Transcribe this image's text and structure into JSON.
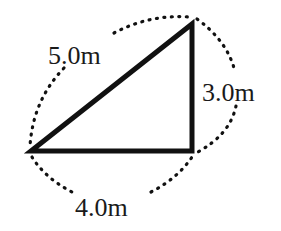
{
  "diagram": {
    "type": "right-triangle",
    "vertices": {
      "left": [
        31,
        151
      ],
      "top_right": [
        192,
        24
      ],
      "bottom_right": [
        192,
        151
      ]
    },
    "sides": [
      {
        "name": "hypotenuse",
        "label": "5.0m",
        "length": 5.0
      },
      {
        "name": "vertical",
        "label": "3.0m",
        "length": 3.0
      },
      {
        "name": "horizontal",
        "label": "4.0m",
        "length": 4.0
      }
    ],
    "colors": {
      "stroke": "#111111",
      "background": "#ffffff",
      "text": "#1a1a1a"
    }
  }
}
